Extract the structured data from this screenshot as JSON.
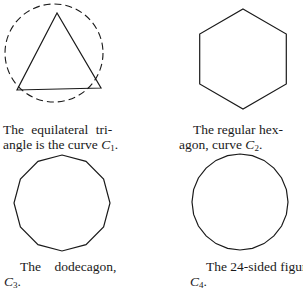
{
  "figures": [
    {
      "id": "C1",
      "shape": "equilateral-triangle-inscribed-in-dashed-circle",
      "caption_line1": "The equilateral tri-",
      "caption_line2_prefix": "angle is the curve ",
      "curve_letter": "C",
      "curve_index": "1",
      "caption_line2_suffix": "."
    },
    {
      "id": "C2",
      "shape": "regular-hexagon",
      "caption_line1": "The regular hex-",
      "caption_line2_prefix": "agon, curve ",
      "curve_letter": "C",
      "curve_index": "2",
      "caption_line2_suffix": "."
    },
    {
      "id": "C3",
      "shape": "regular-dodecagon",
      "caption_line1": "The    dodecagon,",
      "caption_line2_prefix": "",
      "curve_letter": "C",
      "curve_index": "3",
      "caption_line2_suffix": "."
    },
    {
      "id": "C4",
      "shape": "regular-24-gon",
      "caption_line1": "The 24-sided figure,",
      "caption_line2_prefix": "",
      "curve_letter": "C",
      "curve_index": "4",
      "caption_line2_suffix": "."
    }
  ],
  "colors": {
    "stroke": "#1a1a1a",
    "background": "#ffffff"
  }
}
